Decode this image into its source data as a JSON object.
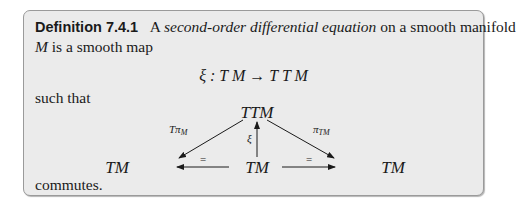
{
  "definition": {
    "label": "Definition 7.4.1",
    "text_before": "A ",
    "term": "second-order differential equation",
    "text_after": " on a smooth manifold",
    "line2_var": "M",
    "line2_text": " is a smooth map",
    "equation": "ξ : T M → T T M",
    "such_that": "such that",
    "closing": "commutes."
  },
  "diagram": {
    "top_node": "TTM",
    "left_node": "TM",
    "center_node": "TM",
    "right_node": "TM",
    "left_arrow_label": "Tπ",
    "left_arrow_sub": "M",
    "right_arrow_label": "π",
    "right_arrow_sub": "TM",
    "center_arrow_label": "ξ",
    "bottom_left_label": "=",
    "bottom_right_label": "="
  }
}
